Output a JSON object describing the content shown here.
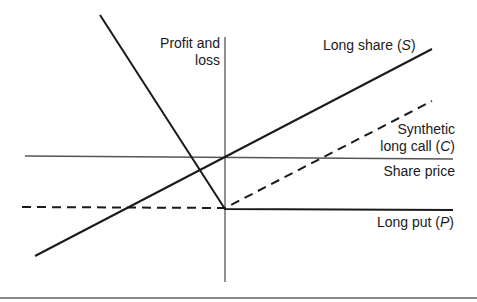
{
  "diagram": {
    "axes": {
      "y_label_line1": "Profit and",
      "y_label_line2": "loss",
      "x_label": "Share price"
    },
    "lines": {
      "long_share": {
        "label_text": "Long share (",
        "label_symbol": "S",
        "label_close": ")",
        "style": "solid"
      },
      "synthetic_long_call": {
        "label_line1": "Synthetic",
        "label_text": "long call (",
        "label_symbol": "C",
        "label_close": ")",
        "style": "dashed"
      },
      "long_put": {
        "label_text": "Long put (",
        "label_symbol": "P",
        "label_close": ")",
        "style": "solid"
      }
    },
    "colors": {
      "line": "#1a1a1a",
      "axis": "#555555",
      "rule": "#8a8a8a"
    }
  }
}
